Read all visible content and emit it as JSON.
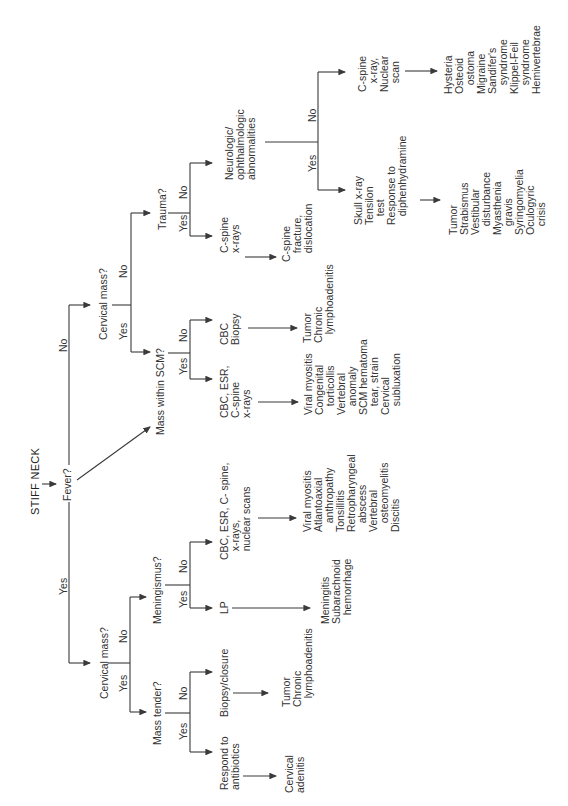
{
  "title": "STIFF NECK",
  "nodes": {
    "fever": "Fever?",
    "yes_fever": "Yes",
    "no_fever": "No",
    "cervical_mass_left": "Cervical mass?",
    "cm_left_yes": "Yes",
    "cm_left_no": "No",
    "mass_tender": "Mass tender?",
    "mt_yes": "Yes",
    "mt_no": "No",
    "respond_antibiotics": "Respond to\nantibiotics",
    "cervical_adenitis": "Cervical\nadenitis",
    "biopsy_closure": "Biopsy/closure",
    "tumor_chronic_1": "Tumor\nChronic\n   lymphoadenitis",
    "meningismus": "Meningismus?",
    "men_yes": "Yes",
    "men_no": "No",
    "lp": "LP",
    "meningitis": "Meningitis\nSubarachnoid\n   hemorrhage",
    "cbc_esr_scans": "CBC, ESR, C- spine,\n   x-rays,\n   nuclear scans",
    "viral_list_1": "Viral myositis\nAtlantoaxial\n   anthropathy\nTonsillitis\nRetropharyngeal\n   abscess\nVertebral\n   osteomyelitis\nDiscitis",
    "mass_within_scm": "Mass within SCM?",
    "scm_yes": "Yes",
    "scm_no": "No",
    "cbc_esr_cspine": "CBC, ESR,\nC-spine\nx-rays",
    "viral_list_2": "Viral myositis\nCongenital\n   torticollis\nVertebral\n   anomaly\nSCM hematoma\n   tear, strain\nCervical\n   subluxation",
    "cbc_biopsy": "CBC\nBiopsy",
    "tumor_chronic_2": "Tumor\nChronic\n   lymphoadenitis",
    "cervical_mass_right": "Cervical mass?",
    "cm_right_yes": "Yes",
    "cm_right_no": "No",
    "trauma": "Trauma?",
    "tr_yes": "Yes",
    "tr_no": "No",
    "cspine_xrays": "C-spine\nx-rays",
    "cspine_fracture": "C-spine\n   fracture,\n   dislocation",
    "neuro": "Neurologic/\nophthalmologic\nabnormalities",
    "neuro_yes": "Yes",
    "neuro_no": "No",
    "skull_xray": "Skull x-ray\nTensilon\n   test\nResponse to\n   diphenhydramine",
    "tumor_list": "Tumor\nStrabismus\nVestibular\n   disturbance\nMyasthenia\n   gravis\nSyringomyelia\nOculogyric\n   crisis",
    "cspine_nuclear": "C-spine\n   x-ray,\nNuclear\n   scan",
    "hysteria_list": "Hysteria\nOsteoid\n   ostoma\nMigraine\nSandifer's\n   syndrome\nKlippel-Feil\n   syndrome\nHemivertebrae"
  }
}
